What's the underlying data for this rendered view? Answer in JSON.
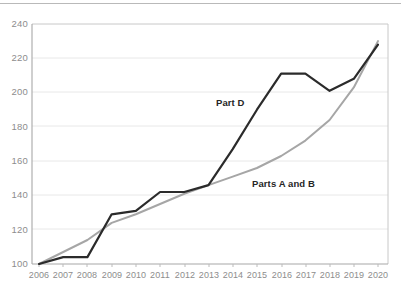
{
  "chart_data": {
    "type": "line",
    "title": "",
    "subtitle": "",
    "xlabel": "",
    "ylabel": "",
    "categories": [
      "2006",
      "2007",
      "2008",
      "2009",
      "2010",
      "2011",
      "2012",
      "2013",
      "2014",
      "2015",
      "2016",
      "2017",
      "2018",
      "2019",
      "2020"
    ],
    "x": [
      2006,
      2007,
      2008,
      2009,
      2010,
      2011,
      2012,
      2013,
      2014,
      2015,
      2016,
      2017,
      2018,
      2019,
      2020
    ],
    "xlim": [
      2006,
      2020
    ],
    "ylim": [
      100,
      240
    ],
    "yticks": [
      100,
      120,
      140,
      160,
      180,
      200,
      220,
      240
    ],
    "ytick_labels": [
      "100",
      "120",
      "140",
      "160",
      "180",
      "200",
      "220",
      "240"
    ],
    "xtick_labels": [
      "2006",
      "2007",
      "2008",
      "2009",
      "2010",
      "2011",
      "2012",
      "2013",
      "2014",
      "2015",
      "2016",
      "2017",
      "2018",
      "2019",
      "2020"
    ],
    "grid": "horizontal",
    "legend_position": "inline-annotations",
    "series": [
      {
        "name": "Part D",
        "color": "#2b2b2b",
        "width": 2.2,
        "values": [
          100,
          104,
          104,
          129,
          131,
          142,
          142,
          146,
          167,
          190,
          211,
          211,
          201,
          208,
          228
        ]
      },
      {
        "name": "Parts A and B",
        "color": "#a6a6a6",
        "width": 2.0,
        "values": [
          100,
          107,
          114,
          124,
          129,
          135,
          141,
          146,
          151,
          156,
          163,
          172,
          184,
          203,
          230
        ]
      }
    ],
    "annotations": [
      {
        "text": "Part D",
        "series": "Part D"
      },
      {
        "text": "Parts A and B",
        "series": "Parts A and B"
      }
    ]
  },
  "axes": {
    "y_labels": [
      "240",
      "220",
      "200",
      "180",
      "160",
      "140",
      "120",
      "100"
    ],
    "x_labels": [
      "2006",
      "2007",
      "2008",
      "2009",
      "2010",
      "2011",
      "2012",
      "2013",
      "2014",
      "2015",
      "2016",
      "2017",
      "2018",
      "2019",
      "2020"
    ]
  },
  "labels": {
    "part_d": "Part D",
    "parts_a_and_b": "Parts A and B"
  },
  "colors": {
    "part_d_line": "#2b2b2b",
    "parts_ab_line": "#a6a6a6",
    "gridline": "#e4e4e4",
    "frame": "#c8c8c8",
    "tick_text": "#8d8d8d",
    "background": "#ffffff"
  }
}
